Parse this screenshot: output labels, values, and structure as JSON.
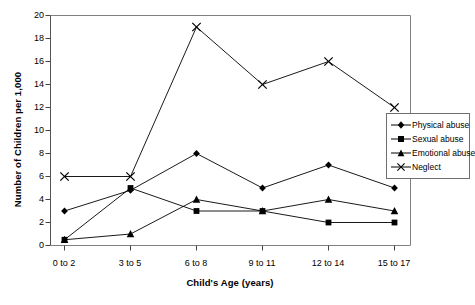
{
  "chart_data": {
    "type": "line",
    "title": "",
    "xlabel": "Child's Age (years)",
    "ylabel": "Number of Children per 1,000",
    "categories": [
      "0 to 2",
      "3 to 5",
      "6 to 8",
      "9 to 11",
      "12 to 14",
      "15 to 17"
    ],
    "ylim": [
      0,
      20
    ],
    "yticks": [
      0,
      2,
      4,
      6,
      8,
      10,
      12,
      14,
      16,
      18,
      20
    ],
    "ytick_labels": [
      "0",
      "2",
      "4",
      "6",
      "8",
      "10",
      "12",
      "14",
      "16",
      "18",
      "20"
    ],
    "grid": false,
    "legend_position": "right",
    "series": [
      {
        "name": "Physical abuse",
        "marker": "diamond",
        "color": "#000000",
        "values": [
          3,
          4.8,
          8,
          5,
          7,
          5
        ]
      },
      {
        "name": "Sexual abuse",
        "marker": "square",
        "color": "#000000",
        "values": [
          0.5,
          5,
          3,
          3,
          2,
          2
        ]
      },
      {
        "name": "Emotional abuse",
        "marker": "triangle",
        "color": "#000000",
        "values": [
          0.5,
          1,
          4,
          3,
          4,
          3
        ]
      },
      {
        "name": "Neglect",
        "marker": "cross",
        "color": "#000000",
        "values": [
          6,
          6,
          19,
          14,
          16,
          12
        ]
      }
    ]
  },
  "legend": {
    "items": [
      {
        "label": "Physical abuse",
        "marker": "diamond-marker-icon"
      },
      {
        "label": "Sexual abuse",
        "marker": "square-marker-icon"
      },
      {
        "label": "Emotional abuse",
        "marker": "triangle-marker-icon"
      },
      {
        "label": "Neglect",
        "marker": "cross-marker-icon"
      }
    ]
  }
}
